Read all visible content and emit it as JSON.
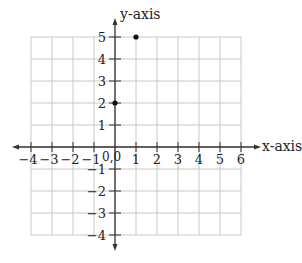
{
  "diagram": {
    "type": "coordinate-plane",
    "x_axis_label": "x-axis",
    "y_axis_label": "y-axis",
    "origin_label": "0,0",
    "x_range": [
      -4,
      6
    ],
    "y_range": [
      -4,
      5
    ],
    "x_ticks": [
      "-4",
      "-3",
      "-2",
      "-1",
      "1",
      "2",
      "3",
      "4",
      "5",
      "6"
    ],
    "y_ticks": [
      "5",
      "4",
      "3",
      "2",
      "1",
      "-1",
      "-2",
      "-3",
      "-4"
    ],
    "points": [
      {
        "x": 1,
        "y": 5
      },
      {
        "x": 0,
        "y": 2
      }
    ],
    "colors": {
      "grid": "#c8c8c8",
      "axis": "#333333",
      "point": "#111111"
    }
  }
}
